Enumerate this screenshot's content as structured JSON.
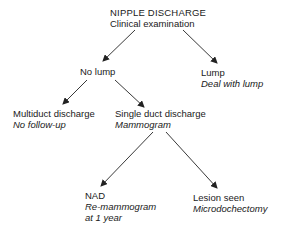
{
  "diagram": {
    "type": "flowchart",
    "root": {
      "title": "NIPPLE DISCHARGE",
      "action": "Clinical examination"
    },
    "nodes": {
      "no_lump": {
        "title": "No lump"
      },
      "lump": {
        "title": "Lump",
        "action": "Deal with lump"
      },
      "multiduct": {
        "title": "Multiduct discharge",
        "action": "No follow-up"
      },
      "single_duct": {
        "title": "Single duct discharge",
        "action": "Mammogram"
      },
      "nad": {
        "title": "NAD",
        "action_line1": "Re-mammogram",
        "action_line2": "at 1 year"
      },
      "lesion": {
        "title": "Lesion seen",
        "action": "Microdochectomy"
      }
    },
    "edges": [
      {
        "from": "root",
        "to": "no_lump"
      },
      {
        "from": "root",
        "to": "lump"
      },
      {
        "from": "no_lump",
        "to": "multiduct"
      },
      {
        "from": "no_lump",
        "to": "single_duct"
      },
      {
        "from": "single_duct",
        "to": "nad"
      },
      {
        "from": "single_duct",
        "to": "lesion"
      }
    ],
    "colors": {
      "text": "#1a1a1a",
      "arrow": "#222222",
      "background": "#ffffff"
    }
  }
}
